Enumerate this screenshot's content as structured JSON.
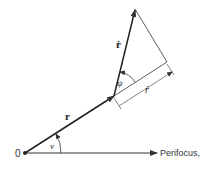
{
  "diagram": {
    "origin_label": "0",
    "axis_label": "Perifocus,",
    "labels": {
      "r_vector": "r",
      "r_dot_vector": "ṙ",
      "r_dot_scalar": "ṙ",
      "angle_v": "v",
      "angle_psi": "ψ"
    },
    "colors": {
      "line": "#333333",
      "background": "#ffffff"
    }
  }
}
